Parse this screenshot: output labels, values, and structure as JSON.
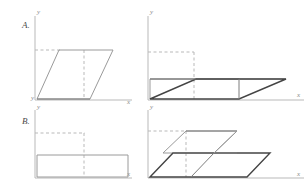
{
  "figure": {
    "background_color": "#ffffff",
    "width": 307,
    "height": 186,
    "colors": {
      "axis": "#b9b9b9",
      "guide_dashed": "#b9b9b9",
      "shape_light": "#9a9a9a",
      "shape_dark": "#444444",
      "shape_mid": "#7d7d7d",
      "row_label_text": "#4a4a4a",
      "axis_label_text": "#8a8a8a"
    }
  },
  "rows": [
    {
      "label": "A.",
      "panels": [
        {
          "name": "original-parallelogram",
          "axis_x_label": "x",
          "axis_y_label": "y",
          "origin_label": "y"
        },
        {
          "name": "sheared-parallelogram",
          "axis_x_label": "x",
          "axis_y_label": "y"
        }
      ]
    },
    {
      "label": "B.",
      "panels": [
        {
          "name": "original-rectangle",
          "axis_x_label": "x",
          "axis_y_label": "y"
        },
        {
          "name": "sheared-rectangle",
          "axis_x_label": "x",
          "axis_y_label": "y"
        }
      ]
    }
  ],
  "geometry": {
    "panel_a_left": {
      "axis": {
        "y_top": 16,
        "y_bottom": 100,
        "x_left": 35,
        "x_right": 132
      },
      "parallelogram": [
        [
          37,
          99
        ],
        [
          59,
          50
        ],
        [
          113,
          50
        ],
        [
          90,
          99
        ]
      ],
      "dashed_horizontal": [
        [
          35,
          50
        ],
        [
          59,
          50
        ]
      ],
      "dashed_vertical": [
        [
          84,
          50
        ],
        [
          84,
          99
        ]
      ],
      "inner_diagonal": [
        [
          113,
          50
        ],
        [
          90,
          99
        ]
      ]
    },
    "panel_a_right": {
      "axis": {
        "y_top": 16,
        "y_bottom": 100,
        "x_left": 148,
        "x_right": 304
      },
      "dashed_box": [
        [
          148,
          52
        ],
        [
          194,
          52
        ],
        [
          194,
          99
        ]
      ],
      "back_rect": [
        [
          150,
          79
        ],
        [
          286,
          79
        ],
        [
          239,
          99
        ],
        [
          150,
          99
        ]
      ],
      "front_parallelogram": [
        [
          150,
          99
        ],
        [
          196,
          79
        ],
        [
          286,
          79
        ],
        [
          239,
          99
        ]
      ],
      "mid_vertical": [
        [
          239,
          79
        ],
        [
          239,
          99
        ]
      ],
      "dashed_vertical": [
        [
          194,
          52
        ],
        [
          194,
          99
        ]
      ]
    },
    "panel_b_left": {
      "axis": {
        "y_top": 110,
        "y_bottom": 178,
        "x_left": 35,
        "x_right": 132
      },
      "rectangle": [
        [
          37,
          155
        ],
        [
          128,
          155
        ],
        [
          128,
          177
        ],
        [
          37,
          177
        ]
      ],
      "dashed_horizontal": [
        [
          35,
          133
        ],
        [
          84,
          133
        ]
      ],
      "dashed_vertical": [
        [
          84,
          133
        ],
        [
          84,
          177
        ]
      ]
    },
    "panel_b_right": {
      "axis": {
        "y_top": 110,
        "y_bottom": 178,
        "x_left": 148,
        "x_right": 304
      },
      "top_parallelogram": [
        [
          163,
          153
        ],
        [
          186,
          131
        ],
        [
          237,
          131
        ],
        [
          214,
          153
        ]
      ],
      "bottom_parallelogram": [
        [
          150,
          177
        ],
        [
          173,
          153
        ],
        [
          270,
          153
        ],
        [
          247,
          177
        ]
      ],
      "dashed_horizontal": [
        [
          148,
          131
        ],
        [
          186,
          131
        ]
      ],
      "dashed_vertical": [
        [
          186,
          131
        ],
        [
          186,
          177
        ]
      ],
      "inner_diagonal": [
        [
          237,
          131
        ],
        [
          214,
          177
        ]
      ]
    }
  }
}
